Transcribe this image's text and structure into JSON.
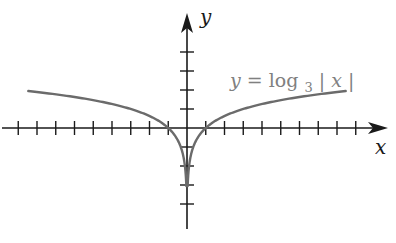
{
  "chart_data": {
    "type": "line",
    "title": "",
    "xlabel": "x",
    "ylabel": "y",
    "series": [
      {
        "name": "y = log3|x|",
        "function": "log3(abs(x))",
        "x": [
          -8.7,
          -6,
          -4,
          -3,
          -2,
          -1,
          -0.5,
          -0.2,
          -0.05,
          0.05,
          0.2,
          0.5,
          1,
          2,
          3,
          4,
          6,
          8.7
        ],
        "values": [
          1.97,
          1.63,
          1.26,
          1.0,
          0.63,
          0.0,
          -0.63,
          -1.46,
          -2.73,
          -2.73,
          -1.46,
          -0.63,
          0.0,
          0.63,
          1.0,
          1.26,
          1.63,
          1.97
        ]
      }
    ],
    "xlim": [
      -9.3,
      10.4
    ],
    "ylim": [
      -5.4,
      6.0
    ],
    "x_ticks_count_left": 9,
    "x_ticks_count_right": 9,
    "y_ticks_count_up": 4,
    "y_ticks_count_down": 4,
    "tick_spacing_units": 1,
    "grid": false,
    "legend": "inline label near right branch",
    "annotations": [
      {
        "text": "y = log3|x|",
        "position": "upper right of curve"
      }
    ],
    "colors": {
      "curve": "#6b6b6b",
      "axes": "#1a1a1a",
      "label": "#808080"
    }
  },
  "labels": {
    "x_axis": "x",
    "y_axis": "y",
    "equation_y": "y",
    "equation_eq": " = log",
    "equation_sub": "3",
    "equation_abs_open": "|",
    "equation_var": "x",
    "equation_abs_close": "|"
  }
}
